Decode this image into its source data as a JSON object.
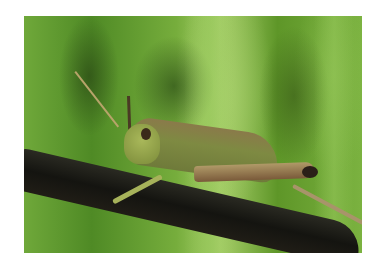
{
  "image": {
    "subject": "grasshopper on a dark stem",
    "background": "blurred green grass",
    "colors": {
      "background_green": "#6fa83a",
      "light_green": "#a8cf6a",
      "stem": "#141410",
      "body": "#7e8a42",
      "leg": "#b09a68"
    }
  }
}
